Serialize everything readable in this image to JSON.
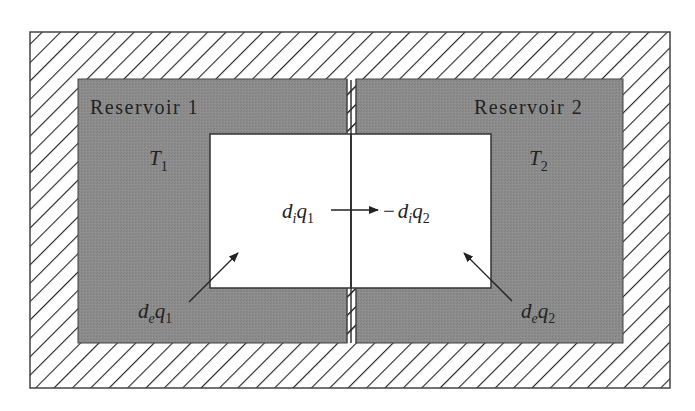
{
  "diagram": {
    "type": "thermodynamic two-reservoir heat exchange",
    "colors": {
      "hatch": "#222222",
      "reservoir_fill": "#8a8a8a",
      "system_fill": "#ffffff",
      "outline": "#333333"
    },
    "reservoirs": [
      {
        "label": "Reservoir 1",
        "temp_symbol": "T",
        "temp_sub": "1"
      },
      {
        "label": "Reservoir 2",
        "temp_symbol": "T",
        "temp_sub": "2"
      }
    ],
    "internal_flow": {
      "left": {
        "d": "d",
        "d_sub": "i",
        "q": "q",
        "q_sub": "1"
      },
      "right": {
        "minus": "−",
        "d": "d",
        "d_sub": "i",
        "q": "q",
        "q_sub": "2"
      }
    },
    "external_flows": [
      {
        "d": "d",
        "d_sub": "e",
        "q": "q",
        "q_sub": "1"
      },
      {
        "d": "d",
        "d_sub": "e",
        "q": "q",
        "q_sub": "2"
      }
    ]
  }
}
